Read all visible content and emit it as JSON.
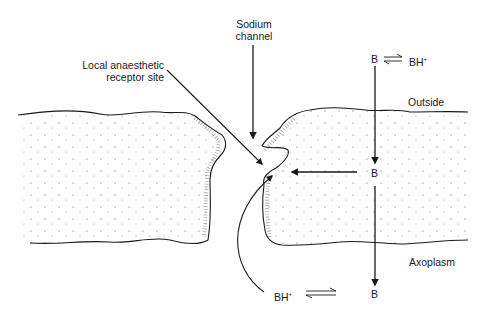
{
  "diagram": {
    "type": "membrane-cross-section",
    "labels": {
      "sodium_channel_line1": "Sodium",
      "sodium_channel_line2": "channel",
      "receptor_line1": "Local anaesthetic",
      "receptor_line2": "receptor site",
      "outside": "Outside",
      "axoplasm": "Axoplasm"
    },
    "species": {
      "top_base": "B",
      "top_acid": "BH",
      "top_acid_charge": "+",
      "middle_base": "B",
      "bottom_acid": "BH",
      "bottom_acid_charge": "+",
      "bottom_base": "B"
    },
    "colors": {
      "ink": "#1a1a1a",
      "background": "#ffffff"
    }
  }
}
